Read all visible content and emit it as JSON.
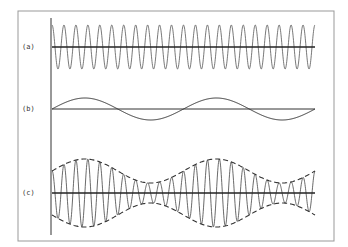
{
  "figure": {
    "frame": {
      "x": 18,
      "y": 11,
      "width": 316,
      "height": 230,
      "color": "#999999"
    },
    "vertical_axis": {
      "x": 51,
      "y1": 18,
      "y2": 235
    },
    "panels": [
      {
        "id": "a",
        "label": "(a)",
        "description": "Carrier wave (high frequency, constant amplitude)",
        "axis_y": 47,
        "x_start": 52,
        "x_end": 315,
        "amplitude": 22,
        "cycles": 22,
        "phase": 1.5708,
        "stroke": "#555555"
      },
      {
        "id": "b",
        "label": "(b)",
        "description": "Modulating signal (low frequency sine)",
        "axis_y": 109,
        "x_start": 52,
        "x_end": 315,
        "amplitude": 11,
        "cycles": 2,
        "phase": 0,
        "stroke": "#333333"
      },
      {
        "id": "c",
        "label": "(c)",
        "description": "Amplitude-modulated wave with dashed envelope",
        "axis_y": 193,
        "x_start": 52,
        "x_end": 315,
        "carrier_cycles": 22,
        "envelope_mean": 22,
        "envelope_depth": 12,
        "envelope_cycles": 2,
        "stroke": "#444444",
        "envelope_style": "dashed"
      }
    ]
  }
}
